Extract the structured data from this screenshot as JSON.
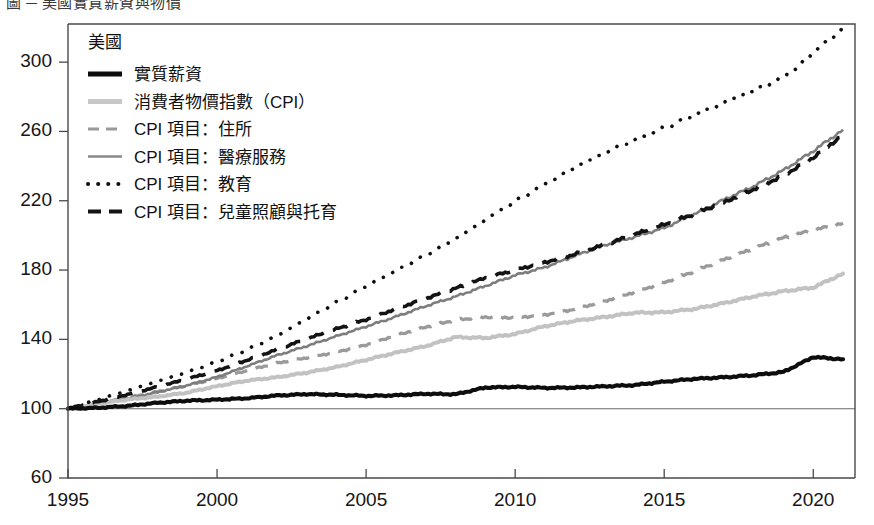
{
  "page": {
    "top_crumb": "圖 ─ 美國實質薪資與物價",
    "background": "#ffffff"
  },
  "chart_data": {
    "type": "line",
    "title": "",
    "subtitle": "",
    "xlabel": "",
    "ylabel": "",
    "index_base": "1995 = 100",
    "xlim": [
      1995,
      2021.4
    ],
    "ylim": [
      60,
      322
    ],
    "grid": false,
    "baseline": 100,
    "legend_position": "top-left inside plot",
    "legend_title": "美國",
    "xticks": [
      1995,
      2000,
      2005,
      2010,
      2015,
      2020
    ],
    "xticklabels": [
      "1995",
      "2000",
      "2005",
      "2010",
      "2015",
      "2020"
    ],
    "yticks": [
      60,
      100,
      140,
      180,
      220,
      260,
      300
    ],
    "yticklabels": [
      "60",
      "100",
      "140",
      "180",
      "220",
      "260",
      "300"
    ],
    "x": [
      1995,
      1996,
      1997,
      1998,
      1999,
      2000,
      2001,
      2002,
      2003,
      2004,
      2005,
      2006,
      2007,
      2008,
      2009,
      2010,
      2011,
      2012,
      2013,
      2014,
      2015,
      2016,
      2017,
      2018,
      2019,
      2020,
      2021
    ],
    "series": [
      {
        "name": "實質薪資",
        "key": "real_wages",
        "color": "#0d0d0d",
        "style": "solid-thick",
        "legend_swatch": "sw-wage",
        "end_value": 130,
        "values": [
          100,
          100.5,
          101.6,
          103.4,
          104.6,
          105.2,
          106.0,
          107.6,
          108.4,
          108.0,
          107.4,
          107.7,
          108.6,
          108.3,
          112.2,
          112.6,
          112.0,
          112.2,
          112.9,
          113.6,
          115.6,
          117.2,
          118.1,
          119.3,
          121.2,
          129.8,
          128.5
        ]
      },
      {
        "name": "消費者物價指數（CPI）",
        "key": "cpi",
        "color": "#c2c2c2",
        "style": "solid-thick",
        "legend_swatch": "sw-cpi",
        "end_value": 178,
        "values": [
          100,
          102.9,
          105.3,
          106.9,
          109.3,
          113.0,
          116.2,
          118.1,
          120.8,
          124.0,
          128.2,
          132.3,
          136.1,
          141.3,
          140.8,
          143.1,
          147.6,
          150.7,
          152.9,
          155.4,
          155.6,
          157.5,
          160.9,
          164.8,
          167.8,
          169.9,
          178.0
        ]
      },
      {
        "name": "CPI 項目：住所",
        "key": "cpi_shelter",
        "color": "#9a9a9a",
        "style": "dashed",
        "legend_swatch": "sw-house",
        "end_value": 207,
        "values": [
          100,
          103.0,
          106.3,
          109.8,
          113.4,
          117.4,
          122.0,
          126.3,
          129.4,
          132.6,
          136.9,
          142.3,
          147.2,
          151.3,
          152.9,
          152.5,
          154.2,
          157.5,
          162.1,
          167.3,
          172.8,
          179.3,
          186.0,
          192.4,
          198.6,
          203.0,
          207.0
        ]
      },
      {
        "name": "CPI 項目：醫療服務",
        "key": "cpi_medical_services",
        "color": "#7d7d7d",
        "style": "solid",
        "legend_swatch": "sw-med",
        "end_value": 261,
        "values": [
          100,
          103.0,
          105.9,
          109.5,
          113.5,
          118.3,
          124.5,
          130.7,
          136.1,
          141.8,
          147.4,
          153.1,
          159.2,
          164.7,
          170.8,
          177.0,
          181.6,
          188.2,
          194.3,
          199.1,
          204.3,
          212.2,
          220.6,
          228.4,
          237.6,
          248.7,
          261.0
        ]
      },
      {
        "name": "CPI 項目：教育",
        "key": "cpi_education",
        "color": "#101010",
        "style": "dotted",
        "legend_swatch": "sw-edu",
        "end_value": 320,
        "values": [
          100,
          105.2,
          110.4,
          115.8,
          121.1,
          127.1,
          134.0,
          142.0,
          151.7,
          161.2,
          170.8,
          179.6,
          188.6,
          198.0,
          209.0,
          219.7,
          229.6,
          239.2,
          247.6,
          255.0,
          262.0,
          269.4,
          276.6,
          283.7,
          291.0,
          305.0,
          320.0
        ]
      },
      {
        "name": "CPI 項目：兒童照顧與托育",
        "key": "cpi_childcare",
        "color": "#131313",
        "style": "dashed-bold",
        "legend_swatch": "sw-child",
        "end_value": 258,
        "values": [
          100,
          104.1,
          108.2,
          112.6,
          117.1,
          122.0,
          128.0,
          134.1,
          140.2,
          146.0,
          151.5,
          157.6,
          163.6,
          169.4,
          175.5,
          180.0,
          184.5,
          189.2,
          194.6,
          200.5,
          206.2,
          212.4,
          219.1,
          226.6,
          234.6,
          245.0,
          258.0
        ]
      }
    ]
  }
}
